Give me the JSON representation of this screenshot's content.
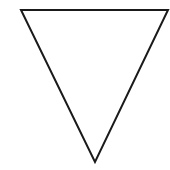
{
  "diagram": {
    "shape": "inverted-triangle",
    "fill": "none",
    "stroke_color": "#1a1a1a",
    "stroke_width": 2,
    "background": "#ffffff",
    "vertices": {
      "top_left": [
        21,
        10
      ],
      "top_right": [
        168,
        10
      ],
      "bottom": [
        95,
        162
      ]
    }
  }
}
